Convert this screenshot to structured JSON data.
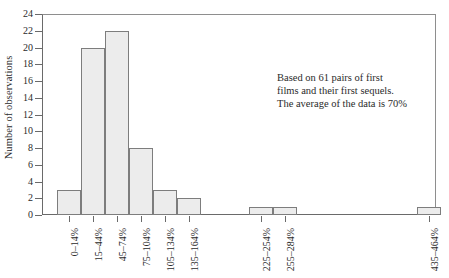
{
  "chart_data": {
    "type": "bar",
    "title": "",
    "xlabel": "",
    "ylabel": "Number of observations",
    "ylim": [
      0,
      24
    ],
    "ytick_step": 2,
    "yticks": [
      24,
      22,
      20,
      18,
      16,
      14,
      12,
      10,
      8,
      6,
      4,
      2,
      0
    ],
    "grid": false,
    "legend": "none",
    "categories": [
      "0–14%",
      "15–44%",
      "45–74%",
      "75–104%",
      "105–134%",
      "135–164%",
      "165–194%",
      "195–224%",
      "225–254%",
      "255–284%",
      "285–314%",
      "315–344%",
      "345–374%",
      "375–404%",
      "405–434%",
      "435–464%"
    ],
    "values": [
      3,
      20,
      22,
      8,
      3,
      2,
      0,
      0,
      1,
      1,
      0,
      0,
      0,
      0,
      0,
      1
    ],
    "visible_tick_labels": [
      "0–14%",
      "15–44%",
      "45–74%",
      "75–104%",
      "105–134%",
      "135–164%",
      "225–254%",
      "255–284%",
      "435–464%"
    ],
    "bar_fill_color": "#ececec",
    "bar_border_color": "#7d7d7d",
    "axis_color": "#6a6a6a"
  },
  "annotation": {
    "line1": "Based on 61 pairs of first",
    "line2": "films and their first sequels.",
    "line3": "The average of the data is 70%"
  },
  "axis": {
    "y_title": "Number of observations"
  }
}
